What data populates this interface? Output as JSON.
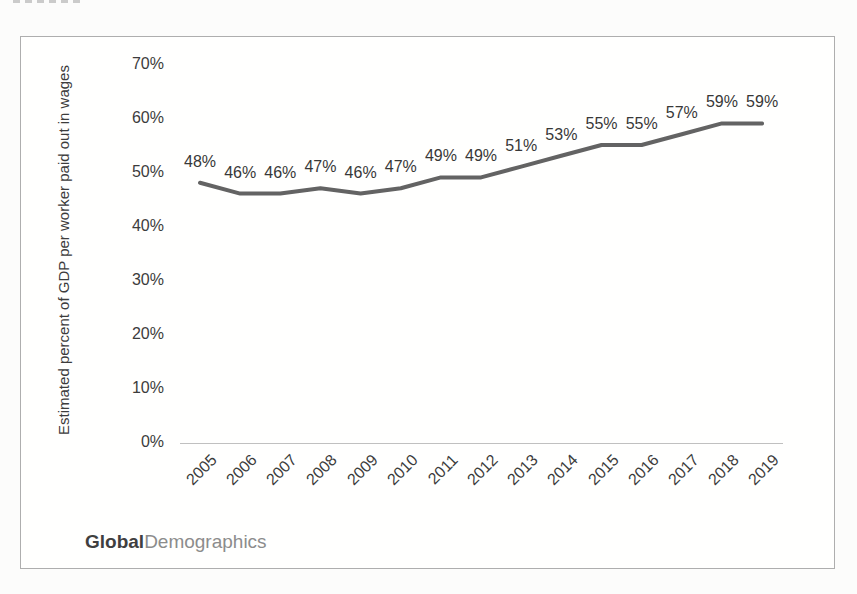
{
  "branding": {
    "bold": "Global",
    "light": "Demographics"
  },
  "chart_data": {
    "type": "line",
    "title": "",
    "categories": [
      "2005",
      "2006",
      "2007",
      "2008",
      "2009",
      "2010",
      "2011",
      "2012",
      "2013",
      "2014",
      "2015",
      "2016",
      "2017",
      "2018",
      "2019"
    ],
    "values": [
      48,
      46,
      46,
      47,
      46,
      47,
      49,
      49,
      51,
      53,
      55,
      55,
      57,
      59,
      59
    ],
    "data_labels": [
      "48%",
      "46%",
      "46%",
      "47%",
      "46%",
      "47%",
      "49%",
      "49%",
      "51%",
      "53%",
      "55%",
      "55%",
      "57%",
      "59%",
      "59%"
    ],
    "xlabel": "",
    "ylabel": "Estimated percent of GDP per worker paid out in wages",
    "ylim": [
      0,
      70
    ],
    "ytick_step": 10,
    "yticks": [
      "0%",
      "10%",
      "20%",
      "30%",
      "40%",
      "50%",
      "60%",
      "70%"
    ],
    "grid": false,
    "legend": "none",
    "line_color": "#636363",
    "data_label_color": "#383838",
    "tick_label_color": "#3c3c3c",
    "axis_line_color": "#c0c0c0",
    "frame_border_color": "#aeaeae"
  }
}
